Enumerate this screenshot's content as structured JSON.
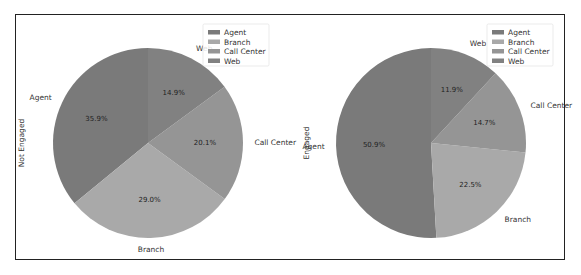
{
  "chart_data": [
    {
      "type": "pie",
      "title": "",
      "ylabel": "Not Engaged",
      "categories": [
        "Agent",
        "Branch",
        "Call Center",
        "Web"
      ],
      "values": [
        35.9,
        29.0,
        20.1,
        14.9
      ],
      "labels_pct": [
        "35.9%",
        "29.0%",
        "20.1%",
        "14.9%"
      ],
      "colors": [
        "#7a7a7a",
        "#a9a9a9",
        "#959595",
        "#818181"
      ],
      "start_angle": 90,
      "direction": "counterclockwise",
      "legend": {
        "entries": [
          "Agent",
          "Branch",
          "Call Center",
          "Web"
        ],
        "position": "upper right"
      }
    },
    {
      "type": "pie",
      "title": "",
      "ylabel": "Engaged",
      "categories": [
        "Agent",
        "Branch",
        "Call Center",
        "Web"
      ],
      "values": [
        50.9,
        22.5,
        14.7,
        11.9
      ],
      "labels_pct": [
        "50.9%",
        "22.5%",
        "14.7%",
        "11.9%"
      ],
      "colors": [
        "#7a7a7a",
        "#a9a9a9",
        "#959595",
        "#818181"
      ],
      "start_angle": 90,
      "direction": "counterclockwise",
      "legend": {
        "entries": [
          "Agent",
          "Branch",
          "Call Center",
          "Web"
        ],
        "position": "upper right"
      }
    }
  ]
}
